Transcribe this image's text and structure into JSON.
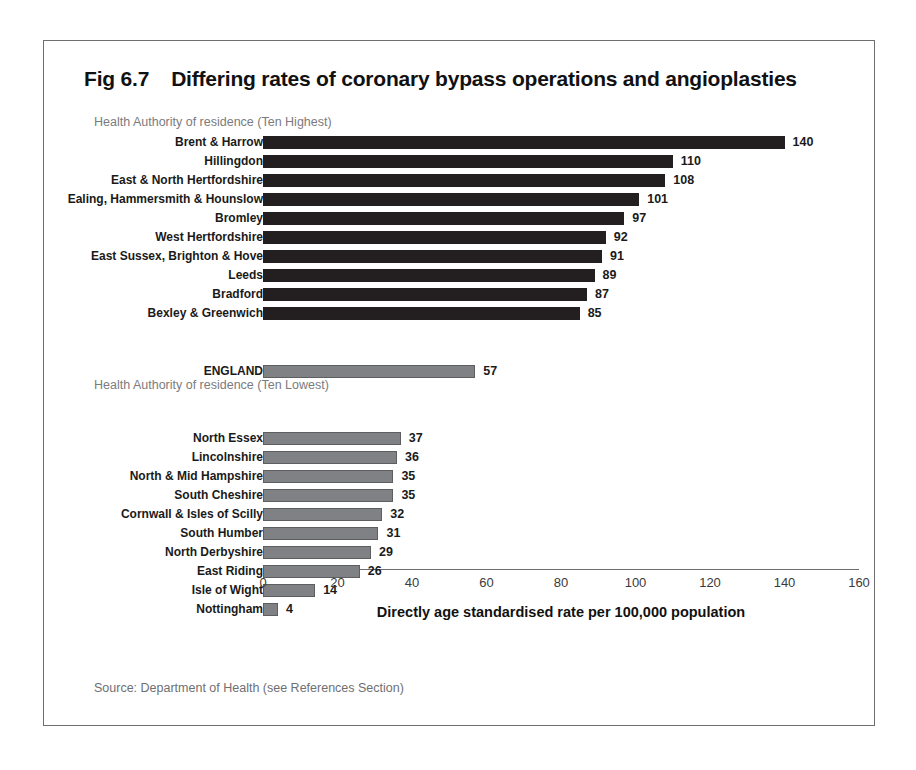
{
  "figure": {
    "number": "Fig 6.7",
    "title": "Differing rates of coronary bypass operations and angioplasties",
    "source": "Source: Department of Health (see References Section)"
  },
  "sections": {
    "highest_caption": "Health Authority of residence (Ten Highest)",
    "lowest_caption": "Health Authority of residence (Ten Lowest)"
  },
  "colors": {
    "bar_dark": "#231f20",
    "bar_grey": "#808184",
    "frame": "#6e6e70",
    "caption_text": "#7b7b7e",
    "background": "#ffffff"
  },
  "chart_data": {
    "type": "bar",
    "orientation": "horizontal",
    "title": "Fig 6.7 Differing rates of coronary bypass operations and angioplasties",
    "subtitle": "",
    "xlabel": "Directly age standardised rate per 100,000 population",
    "ylabel": "",
    "xlim": [
      0,
      160
    ],
    "xticks": [
      0,
      20,
      40,
      60,
      80,
      100,
      120,
      140,
      160
    ],
    "xtick_labels": [
      "0",
      "20",
      "40",
      "60",
      "80",
      "100",
      "120",
      "140",
      "160"
    ],
    "grid": false,
    "legend": false,
    "groups": [
      {
        "name": "Health Authority of residence (Ten Highest)",
        "color": "#231f20",
        "categories": [
          "Brent & Harrow",
          "Hillingdon",
          "East & North Hertfordshire",
          "Ealing, Hammersmith & Hounslow",
          "Bromley",
          "West Hertfordshire",
          "East Sussex, Brighton & Hove",
          "Leeds",
          "Bradford",
          "Bexley & Greenwich"
        ],
        "values": [
          140,
          110,
          108,
          101,
          97,
          92,
          91,
          89,
          87,
          85
        ]
      },
      {
        "name": "England average",
        "color": "#808184",
        "categories": [
          "ENGLAND"
        ],
        "values": [
          57
        ]
      },
      {
        "name": "Health Authority of residence (Ten Lowest)",
        "color": "#808184",
        "categories": [
          "North Essex",
          "Lincolnshire",
          "North & Mid Hampshire",
          "South Cheshire",
          "Cornwall & Isles of Scilly",
          "South Humber",
          "North Derbyshire",
          "East Riding",
          "Isle of Wight",
          "Nottingham"
        ],
        "values": [
          37,
          36,
          35,
          35,
          32,
          31,
          29,
          26,
          14,
          4
        ]
      }
    ]
  }
}
